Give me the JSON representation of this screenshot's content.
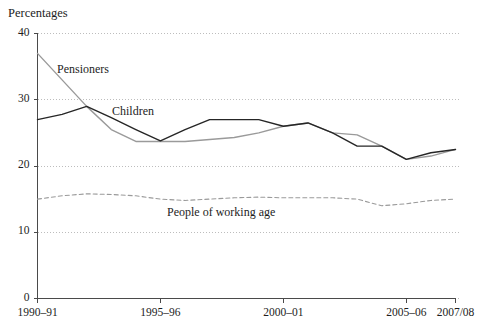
{
  "chart_data": {
    "type": "line",
    "title": "Percentages",
    "xlabel": "",
    "ylabel": "",
    "ylim": [
      0,
      40
    ],
    "yticks": [
      0,
      10,
      20,
      30,
      40
    ],
    "ytick_labels": [
      "0",
      "10",
      "20",
      "30",
      "40"
    ],
    "grid": true,
    "grid_style": "dotted",
    "legend": "inline-annotations",
    "x": [
      "1990-91",
      "1991-92",
      "1992-93",
      "1993-94",
      "1994-95",
      "1995-96",
      "1996-97",
      "1997-98",
      "1998-99",
      "1999-00",
      "2000-01",
      "2001-02",
      "2002-03",
      "2003-04",
      "2004-05",
      "2005-06",
      "2006-07",
      "2007/08"
    ],
    "xtick_positions": [
      "1990-91",
      "1995-96",
      "2000-01",
      "2005-06",
      "2007/08"
    ],
    "xtick_labels": [
      "1990–91",
      "1995–96",
      "2000–01",
      "2005–06",
      "2007/08"
    ],
    "series": [
      {
        "name": "Pensioners",
        "color": "#9a9a9a",
        "style": "solid",
        "label_x": "1991-92",
        "values": [
          37.0,
          33.0,
          29.0,
          25.5,
          23.7,
          23.7,
          23.7,
          24.0,
          24.3,
          25.0,
          26.0,
          26.5,
          25.0,
          24.7,
          23.0,
          21.0,
          21.5,
          22.5
        ]
      },
      {
        "name": "Children",
        "color": "#262626",
        "style": "solid",
        "label_x": "1994-95",
        "values": [
          27.0,
          27.8,
          29.0,
          27.3,
          25.5,
          23.8,
          25.5,
          27.0,
          27.0,
          27.0,
          26.0,
          26.5,
          25.0,
          23.0,
          23.0,
          21.0,
          22.0,
          22.5
        ]
      },
      {
        "name": "People of working age",
        "color": "#9a9a9a",
        "style": "dashed",
        "label_x": "1998-99",
        "values": [
          15.0,
          15.5,
          15.8,
          15.7,
          15.5,
          15.0,
          14.8,
          15.0,
          15.2,
          15.3,
          15.2,
          15.2,
          15.2,
          15.0,
          14.0,
          14.3,
          14.8,
          15.0
        ]
      }
    ],
    "annotations": [
      {
        "text": "Pensioners",
        "x": 57,
        "y": 62
      },
      {
        "text": "Children",
        "x": 112,
        "y": 104
      },
      {
        "text": "People of working age",
        "x": 167,
        "y": 205
      }
    ]
  }
}
